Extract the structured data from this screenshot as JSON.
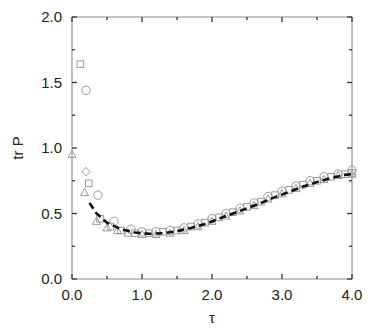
{
  "chart_data": {
    "type": "scatter",
    "title": "",
    "xlabel": "τ",
    "ylabel": "tr P",
    "xlim": [
      0.0,
      4.0
    ],
    "ylim": [
      0.0,
      2.0
    ],
    "xticks": [
      "0.0",
      "1.0",
      "2.0",
      "3.0",
      "4.0"
    ],
    "yticks": [
      "0.0",
      "0.5",
      "1.0",
      "1.5",
      "2.0"
    ],
    "grid": false,
    "legend": null,
    "colors": {
      "axis": "#888888",
      "markers": "#9a9a9a",
      "curve": "#111111"
    },
    "series": [
      {
        "name": "circles",
        "marker": "circle",
        "points": [
          [
            0.2,
            1.44
          ],
          [
            0.37,
            0.64
          ],
          [
            0.6,
            0.44
          ],
          [
            0.84,
            0.38
          ],
          [
            1.0,
            0.36
          ],
          [
            1.2,
            0.36
          ],
          [
            1.4,
            0.37
          ],
          [
            1.6,
            0.39
          ],
          [
            1.8,
            0.42
          ],
          [
            2.0,
            0.46
          ],
          [
            2.2,
            0.5
          ],
          [
            2.4,
            0.54
          ],
          [
            2.6,
            0.58
          ],
          [
            2.8,
            0.63
          ],
          [
            3.0,
            0.67
          ],
          [
            3.2,
            0.71
          ],
          [
            3.4,
            0.75
          ],
          [
            3.6,
            0.78
          ],
          [
            3.8,
            0.8
          ],
          [
            4.0,
            0.83
          ]
        ]
      },
      {
        "name": "squares",
        "marker": "square",
        "points": [
          [
            0.12,
            1.64
          ],
          [
            0.24,
            0.73
          ],
          [
            0.4,
            0.46
          ],
          [
            0.55,
            0.4
          ],
          [
            0.7,
            0.37
          ],
          [
            0.9,
            0.35
          ],
          [
            1.1,
            0.35
          ],
          [
            1.3,
            0.36
          ],
          [
            1.5,
            0.37
          ],
          [
            1.7,
            0.4
          ],
          [
            1.9,
            0.43
          ],
          [
            2.1,
            0.47
          ],
          [
            2.3,
            0.51
          ],
          [
            2.5,
            0.55
          ],
          [
            2.7,
            0.59
          ],
          [
            2.9,
            0.64
          ],
          [
            3.1,
            0.68
          ],
          [
            3.3,
            0.72
          ],
          [
            3.5,
            0.75
          ],
          [
            3.7,
            0.78
          ],
          [
            3.9,
            0.8
          ],
          [
            4.0,
            0.81
          ]
        ]
      },
      {
        "name": "triangles",
        "marker": "triangle",
        "points": [
          [
            0.0,
            0.95
          ],
          [
            0.18,
            0.66
          ],
          [
            0.35,
            0.44
          ],
          [
            0.5,
            0.39
          ],
          [
            0.65,
            0.37
          ],
          [
            0.8,
            0.35
          ],
          [
            1.0,
            0.34
          ],
          [
            1.2,
            0.34
          ],
          [
            1.4,
            0.35
          ],
          [
            1.6,
            0.37
          ],
          [
            1.8,
            0.4
          ],
          [
            2.0,
            0.44
          ],
          [
            2.2,
            0.48
          ],
          [
            2.4,
            0.52
          ],
          [
            2.6,
            0.56
          ],
          [
            2.8,
            0.61
          ],
          [
            3.0,
            0.65
          ],
          [
            3.2,
            0.69
          ],
          [
            3.4,
            0.73
          ],
          [
            3.6,
            0.76
          ],
          [
            3.8,
            0.79
          ],
          [
            4.0,
            0.8
          ]
        ]
      },
      {
        "name": "diamonds",
        "marker": "diamond",
        "points": [
          [
            0.2,
            0.82
          ]
        ]
      },
      {
        "name": "theory",
        "marker": "dashed-line",
        "points": [
          [
            0.25,
            0.58
          ],
          [
            0.35,
            0.5
          ],
          [
            0.5,
            0.43
          ],
          [
            0.7,
            0.38
          ],
          [
            0.9,
            0.355
          ],
          [
            1.1,
            0.345
          ],
          [
            1.3,
            0.35
          ],
          [
            1.5,
            0.365
          ],
          [
            1.7,
            0.39
          ],
          [
            1.9,
            0.42
          ],
          [
            2.1,
            0.46
          ],
          [
            2.3,
            0.5
          ],
          [
            2.5,
            0.54
          ],
          [
            2.7,
            0.58
          ],
          [
            2.9,
            0.625
          ],
          [
            3.1,
            0.665
          ],
          [
            3.3,
            0.705
          ],
          [
            3.5,
            0.74
          ],
          [
            3.7,
            0.77
          ],
          [
            3.9,
            0.795
          ],
          [
            4.0,
            0.8
          ]
        ]
      }
    ]
  },
  "axes": {
    "xlabel": "τ",
    "ylabel": "tr P",
    "xticks": [
      "0.0",
      "1.0",
      "2.0",
      "3.0",
      "4.0"
    ],
    "yticks": [
      "0.0",
      "0.5",
      "1.0",
      "1.5",
      "2.0"
    ]
  }
}
